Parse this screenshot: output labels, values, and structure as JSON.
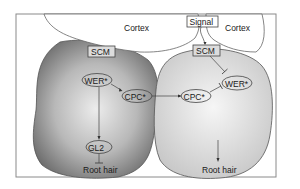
{
  "diagram": {
    "regions": {
      "cortex_left": "Cortex",
      "cortex_right": "Cortex"
    },
    "signal": "Signal",
    "left_cell": {
      "scm": "SCM",
      "wer": "WER*",
      "cpc": "CPC*",
      "gl2": "GL2",
      "outcome": "Root hair"
    },
    "right_cell": {
      "scm": "SCM",
      "wer": "WER*",
      "cpc": "CPC*",
      "outcome": "Root hair"
    },
    "colors": {
      "left_cell_dark": "#6e6e6e",
      "left_cell_light": "#e4e4e4",
      "right_cell_fill": "#d4d4d4",
      "right_cell_light": "#f2f2f2",
      "cortex_fill": "#ffffff",
      "label_box_fill": "#dcdcdc",
      "stroke": "#4a4a4a"
    }
  }
}
